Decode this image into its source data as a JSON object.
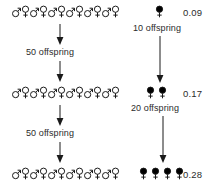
{
  "diagram": {
    "title": "",
    "colors": {
      "outline": "#1a1a1a",
      "filled": "#000000",
      "text": "#2b2b2b",
      "background": "#ffffff"
    },
    "left_column": {
      "generations": [
        {
          "id": "gen-1",
          "symbols": [
            "male",
            "female",
            "male",
            "female",
            "male",
            "female",
            "male",
            "female",
            "male",
            "female",
            "male",
            "female"
          ],
          "count": 12,
          "style": "outline"
        },
        {
          "id": "gen-2",
          "symbols": [
            "male",
            "female",
            "male",
            "female",
            "male",
            "female",
            "male",
            "female",
            "male",
            "female",
            "male",
            "female"
          ],
          "count": 12,
          "style": "outline"
        },
        {
          "id": "gen-3",
          "symbols": [
            "male",
            "female",
            "male",
            "female",
            "male",
            "female",
            "male",
            "female",
            "male",
            "female",
            "male",
            "female"
          ],
          "count": 12,
          "style": "outline"
        }
      ],
      "transitions": [
        {
          "id": "trans-1",
          "label": "50 offspring"
        },
        {
          "id": "trans-2",
          "label": "50 offspring"
        }
      ]
    },
    "right_column": {
      "generations": [
        {
          "id": "r-gen-1",
          "symbols": [
            "female"
          ],
          "count": 1,
          "style": "filled",
          "value": "0.09"
        },
        {
          "id": "r-gen-2",
          "symbols": [
            "female",
            "female"
          ],
          "count": 2,
          "style": "filled",
          "value": "0.17"
        },
        {
          "id": "r-gen-3",
          "symbols": [
            "female",
            "female",
            "female",
            "female"
          ],
          "count": 4,
          "style": "filled",
          "value": "0.28"
        }
      ],
      "transitions": [
        {
          "id": "r-trans-1",
          "label": "10 offspring"
        },
        {
          "id": "r-trans-2",
          "label": "20 offspring"
        }
      ]
    }
  }
}
